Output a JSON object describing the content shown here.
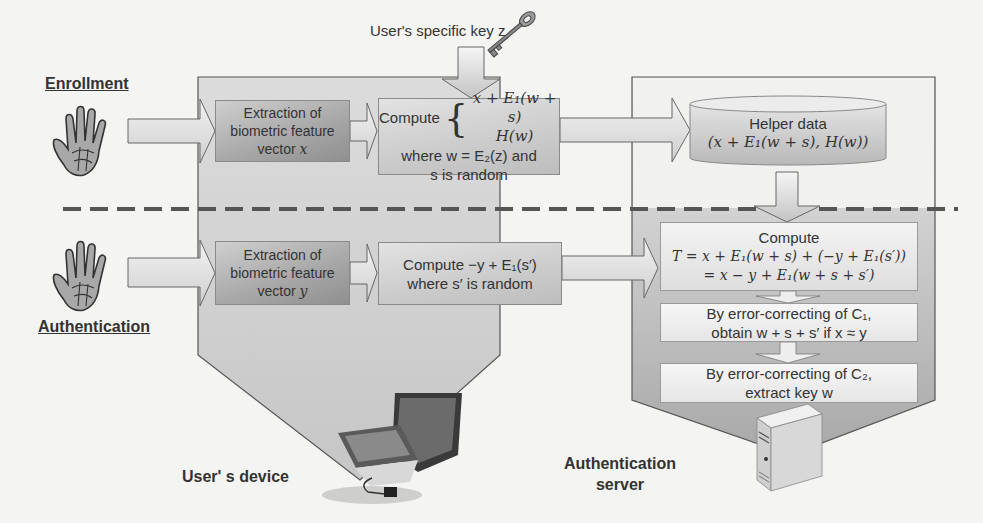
{
  "diagram": {
    "sections": {
      "enrollment": "Enrollment",
      "authentication": "Authentication"
    },
    "key_label": "User's specific key z",
    "enrollment": {
      "extraction": {
        "line1": "Extraction of",
        "line2": "biometric feature",
        "line3_text": "vector ",
        "line3_var": "x"
      },
      "compute": {
        "prefix": "Compute",
        "case1": "x + E₁(w + s)",
        "case2": "H(w)",
        "where_line": "where w = E₂(z) and",
        "random_line": "s is random"
      }
    },
    "authentication": {
      "extraction": {
        "line1": "Extraction of",
        "line2": "biometric feature",
        "line3_text": "vector ",
        "line3_var": "y"
      },
      "compute": {
        "line1": "Compute −y + E₁(s′)",
        "line2": "where s′ is random"
      }
    },
    "server": {
      "helper_data": {
        "title": "Helper data",
        "formula": "(x + E₁(w + s), H(w))"
      },
      "compute_t": {
        "title": "Compute",
        "line1": "T = x + E₁(w + s) + (−y + E₁(s′))",
        "line2": "= x − y + E₁(w + s + s′)"
      },
      "c1_step": {
        "line1": "By error-correcting of C₁,",
        "line2": "obtain w + s + s′ if x ≈ y"
      },
      "c2_step": {
        "line1": "By error-correcting of C₂,",
        "line2": "extract key w"
      }
    },
    "captions": {
      "device": "User' s device",
      "server_line1": "Authentication",
      "server_line2": "server"
    },
    "icons": {
      "hand_enroll": "hand-icon",
      "hand_auth": "hand-icon",
      "key": "key-icon",
      "laptop": "laptop-icon",
      "server": "server-tower-icon",
      "database": "database-cylinder-icon"
    },
    "colors": {
      "background": "#f4f4f2",
      "panel_fill": "#c8c8c8",
      "panel_stroke": "#555555",
      "box_dark": "#a9a9a9",
      "box_white": "#f0f0f0",
      "dash": "#555555",
      "text": "#333333"
    }
  }
}
